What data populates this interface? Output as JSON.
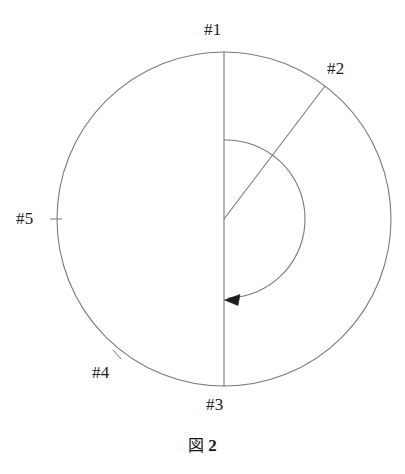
{
  "figure": {
    "caption_symbol": "図",
    "caption_number": "2",
    "stroke_color": "#6a6a6a",
    "text_color": "#1a1a1a",
    "background_color": "#ffffff",
    "labels": {
      "p1": "#1",
      "p2": "#2",
      "p3": "#3",
      "p4": "#4",
      "p5": "#5"
    },
    "geometry": {
      "center_x": 224,
      "center_y": 219,
      "outer_radius": 167,
      "inner_radius": 79,
      "vertical_line_top_y": 52,
      "vertical_line_bottom_y": 386,
      "radial_line_end_x": 325,
      "radial_line_end_y": 86,
      "arrow_tip_x": 226,
      "arrow_tip_y": 300,
      "tick5_x1": 50,
      "tick5_y1": 219,
      "tick5_x2": 62,
      "tick5_y2": 219,
      "tick4_x1": 113,
      "tick4_y1": 350,
      "tick4_x2": 121,
      "tick4_y2": 359
    }
  }
}
